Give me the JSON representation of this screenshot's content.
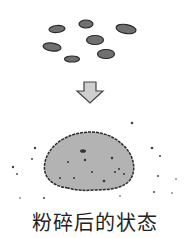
{
  "caption": "粉碎后的状态",
  "icons": {
    "seeds": "whole-seeds-icon",
    "arrow": "down-arrow-icon",
    "pile": "ground-powder-pile-icon"
  },
  "colors": {
    "seed_fill": "#6e6e6e",
    "outline": "#2a2a2a",
    "arrow_fill": "#cfcfcf",
    "pile_fill": "#b3b3b3"
  }
}
